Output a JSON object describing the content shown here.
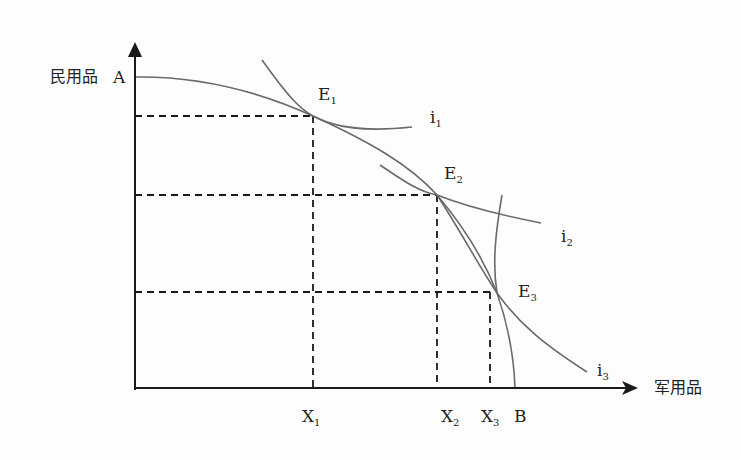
{
  "axes": {
    "y_label": "民用品",
    "x_label": "军用品",
    "origin": [
      135,
      388
    ],
    "y_top": 45,
    "x_right": 635
  },
  "points": {
    "A": {
      "label": "A",
      "x": 135,
      "y": 77
    },
    "B": {
      "label": "B",
      "x": 515,
      "y": 388
    },
    "E1": {
      "label": "E",
      "sub": "1",
      "x": 313,
      "y": 116
    },
    "E2": {
      "label": "E",
      "sub": "2",
      "x": 437,
      "y": 195
    },
    "E3": {
      "label": "E",
      "sub": "3",
      "x": 497,
      "y": 293
    }
  },
  "x_ticks": [
    {
      "label": "X",
      "sub": "1",
      "x": 313
    },
    {
      "label": "X",
      "sub": "2",
      "x": 437
    },
    {
      "label": "X",
      "sub": "3",
      "x": 490
    }
  ],
  "curves": [
    {
      "name": "production-possibility-frontier",
      "label": "",
      "path": "M135,77 C200,76 260,92 313,116 C370,142 410,165 437,195 C465,228 485,262 497,293 C508,325 514,355 515,388"
    },
    {
      "name": "indifference-curve-i1",
      "label": "i",
      "sub": "1",
      "path": "M262,60 C285,92 298,108 313,116 C335,128 365,132 412,127"
    },
    {
      "name": "indifference-curve-i2",
      "label": "i",
      "sub": "2",
      "path": "M380,165 C405,182 420,192 437,195 C470,208 505,216 541,223"
    },
    {
      "name": "indifference-curve-i3",
      "label": "i",
      "sub": "3",
      "path": "M437,195 C460,230 480,268 497,293 C520,325 545,345 587,372"
    },
    {
      "name": "ppf-lower-segment",
      "label": "",
      "path": "M502,195 C496,230 492,262 497,293"
    }
  ],
  "colors": {
    "axis": "#1a1a1a",
    "curve": "#6a6a6a",
    "dash": "#1a1a1a",
    "text": "#222222"
  }
}
